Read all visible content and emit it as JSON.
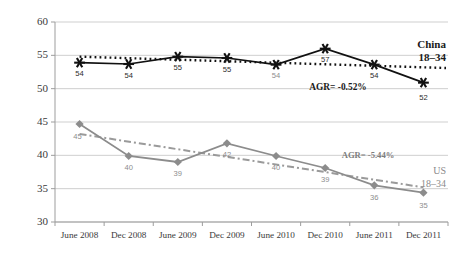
{
  "chart_data": {
    "type": "line",
    "title": "",
    "xlabel": "",
    "ylabel": "",
    "categories": [
      "June 2008",
      "Dec 2008",
      "June 2009",
      "Dec 2009",
      "June 2010",
      "Dec 2010",
      "June 2011",
      "Dec 2011"
    ],
    "ylim": [
      30,
      60
    ],
    "yticks": [
      30,
      35,
      40,
      45,
      50,
      55,
      60
    ],
    "grid": true,
    "legend": "inline-right",
    "series": [
      {
        "name": "China 18-34",
        "name_line1": "China",
        "name_line2": "18–34",
        "values": [
          54,
          54,
          55,
          55,
          54,
          57,
          54,
          52
        ],
        "exact_values": [
          53.9,
          53.7,
          54.8,
          54.6,
          53.6,
          56.0,
          53.6,
          50.9
        ],
        "color": "#111111",
        "marker": "asterisk",
        "linestyle": "solid",
        "trend": {
          "label": "AGR= -0.52%",
          "style": "dotted",
          "color": "#111111",
          "start": 54.8,
          "end": 53.1
        }
      },
      {
        "name": "US 18-34",
        "name_line1": "US",
        "name_line2": "18–34",
        "values": [
          45,
          40,
          39,
          42,
          40,
          39,
          36,
          35
        ],
        "exact_values": [
          44.7,
          39.9,
          39.0,
          41.8,
          39.9,
          38.1,
          35.5,
          34.4
        ],
        "color": "#8c8c8c",
        "marker": "diamond",
        "linestyle": "solid",
        "trend": {
          "label": "AGR= -5.44%",
          "style": "dashdot",
          "color": "#9a9a9a",
          "start": 43.2,
          "end": 35.2
        }
      }
    ]
  },
  "axis": {
    "ytick_labels": [
      "60",
      "55",
      "50",
      "45",
      "40",
      "35",
      "30"
    ],
    "xtick_labels": [
      "June 2008",
      "Dec 2008",
      "June 2009",
      "Dec 2009",
      "June 2010",
      "Dec 2010",
      "June 2011",
      "Dec 2011"
    ]
  },
  "labels": {
    "china_points": [
      "54",
      "54",
      "55",
      "55",
      "54",
      "57",
      "54",
      "52"
    ],
    "us_points": [
      "45",
      "40",
      "39",
      "42",
      "40",
      "39",
      "36",
      "35"
    ],
    "china_agr": "AGR= -0.52%",
    "us_agr": "AGR= -5.44%",
    "china_name_1": "China",
    "china_name_2": "18–34",
    "us_name_1": "US",
    "us_name_2": "18–34"
  },
  "colors": {
    "china": "#111111",
    "us": "#8c8c8c",
    "grid": "#c9c9c9",
    "axis": "#9d9d9d",
    "background": "#ffffff"
  }
}
